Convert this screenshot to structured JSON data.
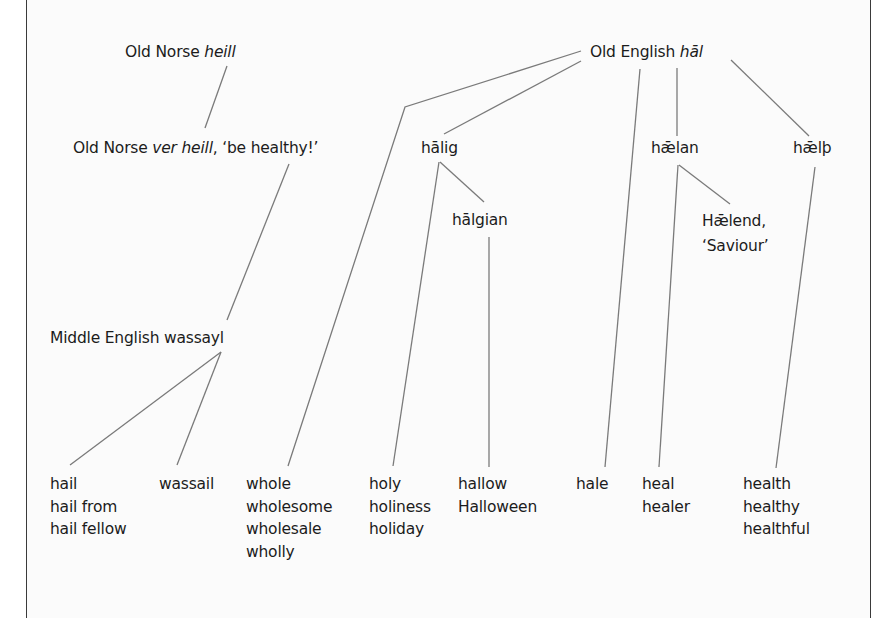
{
  "diagram": {
    "line_color": "#7a7a7a",
    "text_color": "#1c1c1c",
    "nodes": {
      "on_heill": {
        "prefix": "Old Norse ",
        "italic": "heill",
        "suffix": ""
      },
      "on_ver_heill": {
        "prefix": "Old Norse ",
        "italic": "ver heill",
        "suffix": ", ‘be healthy!’"
      },
      "oe_hal": {
        "prefix": "Old English ",
        "italic": "hāl",
        "suffix": ""
      },
      "halig": {
        "label": "hālig"
      },
      "halgian": {
        "label": "hālgian"
      },
      "haelan": {
        "label": "hǣlan"
      },
      "haelend": {
        "line1": "Hǣlend,",
        "line2": "‘Saviour’"
      },
      "haelth": {
        "label": "hǣlþ"
      },
      "me_wassayl": {
        "label": "Middle English wassayl"
      }
    },
    "leaves": {
      "hail": [
        "hail",
        "hail from",
        "hail fellow"
      ],
      "wassail": [
        "wassail"
      ],
      "whole": [
        "whole",
        "wholesome",
        "wholesale",
        "wholly"
      ],
      "holy": [
        "holy",
        "holiness",
        "holiday"
      ],
      "hallow": [
        "hallow",
        "Halloween"
      ],
      "hale": [
        "hale"
      ],
      "heal": [
        "heal",
        "healer"
      ],
      "health": [
        "health",
        "healthy",
        "healthful"
      ]
    },
    "edges": [
      {
        "from": "Old Norse heill",
        "to": "Old Norse ver heill"
      },
      {
        "from": "Old Norse ver heill",
        "to": "Middle English wassayl"
      },
      {
        "from": "Middle English wassayl",
        "to": "hail"
      },
      {
        "from": "Middle English wassayl",
        "to": "wassail"
      },
      {
        "from": "Old English hāl",
        "to": "whole"
      },
      {
        "from": "Old English hāl",
        "to": "hālig"
      },
      {
        "from": "Old English hāl",
        "to": "hale"
      },
      {
        "from": "Old English hāl",
        "to": "hǣlan"
      },
      {
        "from": "Old English hāl",
        "to": "hǣlþ"
      },
      {
        "from": "hālig",
        "to": "holy"
      },
      {
        "from": "hālig",
        "to": "hālgian"
      },
      {
        "from": "hālgian",
        "to": "hallow"
      },
      {
        "from": "hǣlan",
        "to": "heal"
      },
      {
        "from": "hǣlan",
        "to": "Hǣlend"
      },
      {
        "from": "hǣlþ",
        "to": "health"
      }
    ]
  }
}
